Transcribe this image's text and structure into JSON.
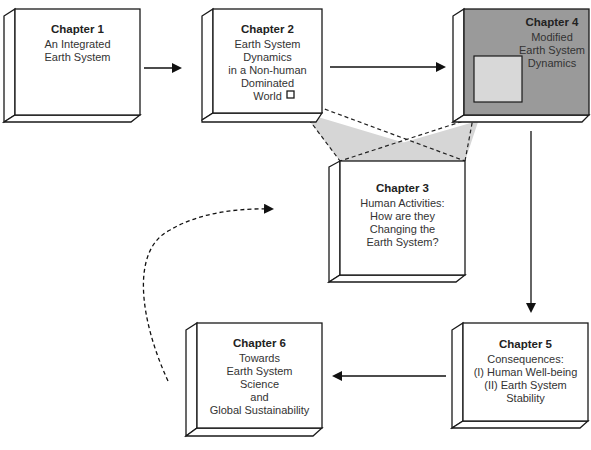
{
  "diagram": {
    "colors": {
      "stroke": "#1a1a1a",
      "box_fill": "#ffffff",
      "highlight_fill": "#9a9a9a",
      "inset_fill": "#d8d8d8",
      "projection_fill": "#d6d6d6"
    },
    "chapters": [
      {
        "id": "ch1",
        "title": "Chapter 1",
        "lines": [
          "An Integrated",
          "Earth System"
        ]
      },
      {
        "id": "ch2",
        "title": "Chapter 2",
        "lines": [
          "Earth System",
          "Dynamics",
          "in a Non-human",
          "Dominated",
          "World"
        ]
      },
      {
        "id": "ch3",
        "title": "Chapter 3",
        "lines": [
          "Human Activities:",
          "How are they",
          "Changing the",
          "Earth System?"
        ]
      },
      {
        "id": "ch4",
        "title": "Chapter 4",
        "lines": [
          "Modified",
          "Earth System",
          "Dynamics"
        ]
      },
      {
        "id": "ch5",
        "title": "Chapter 5",
        "lines": [
          "Consequences:",
          "(I) Human Well-being",
          "(II) Earth System",
          "Stability"
        ]
      },
      {
        "id": "ch6",
        "title": "Chapter 6",
        "lines": [
          "Towards",
          "Earth System",
          "Science",
          "and",
          "Global Sustainability"
        ]
      }
    ],
    "arrows": [
      {
        "from": "ch1",
        "to": "ch2",
        "style": "solid"
      },
      {
        "from": "ch2",
        "to": "ch4",
        "style": "solid"
      },
      {
        "from": "ch4",
        "to": "ch5",
        "style": "solid"
      },
      {
        "from": "ch5",
        "to": "ch6",
        "style": "solid"
      },
      {
        "from": "ch6",
        "to": "ch3",
        "style": "dashed-curve"
      }
    ],
    "caption": ""
  }
}
